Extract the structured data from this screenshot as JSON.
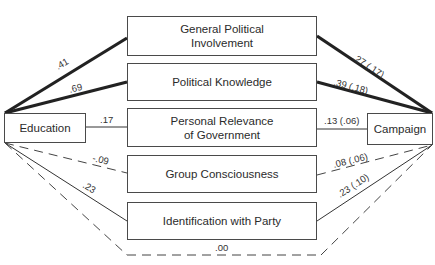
{
  "diagram": {
    "type": "path-model",
    "source": {
      "label": "Education"
    },
    "target": {
      "label": "Campaign"
    },
    "mediators": [
      {
        "label_line1": "General Political",
        "label_line2": "Involvement",
        "edu_coef": ".41",
        "camp_coef": ".27 (.17)",
        "edu_style": "thick",
        "camp_style": "thick"
      },
      {
        "label_line1": "Political Knowledge",
        "label_line2": "",
        "edu_coef": ".69",
        "camp_coef": ".39 (.18)",
        "edu_style": "thick",
        "camp_style": "thick"
      },
      {
        "label_line1": "Personal Relevance",
        "label_line2": "of Government",
        "edu_coef": ".17",
        "camp_coef": ".13 (.06)",
        "edu_style": "thin",
        "camp_style": "thin"
      },
      {
        "label_line1": "Group Consciousness",
        "label_line2": "",
        "edu_coef": "-.09",
        "camp_coef": ".08 (.06)",
        "edu_style": "dashed",
        "camp_style": "dashed"
      },
      {
        "label_line1": "Identification with Party",
        "label_line2": "",
        "edu_coef": ".23",
        "camp_coef": ".23 (.10)",
        "edu_style": "thin",
        "camp_style": "thin"
      }
    ],
    "direct_path": {
      "coef": ".00",
      "style": "dashed"
    }
  }
}
